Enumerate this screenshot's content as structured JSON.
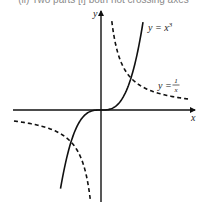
{
  "caption": "(ii) Two parts [i] both not crossing axes",
  "chart_data": {
    "type": "line",
    "title": "",
    "xlabel": "x",
    "ylabel": "y",
    "grid": false,
    "legend": "inline labels",
    "axis_origin_px": [
      101,
      110
    ],
    "scale_px_per_unit": {
      "x": 30,
      "y": 32
    },
    "series": [
      {
        "name": "y = x^3",
        "label": "y = x³",
        "style": "solid",
        "function": "x^3",
        "x_range": [
          -1.35,
          1.4
        ],
        "points": [
          [
            -1.35,
            -2.46
          ],
          [
            -1,
            -1
          ],
          [
            -0.5,
            -0.125
          ],
          [
            0,
            0
          ],
          [
            0.5,
            0.125
          ],
          [
            1,
            1
          ],
          [
            1.4,
            2.74
          ]
        ]
      },
      {
        "name": "y = 1/x",
        "label": "y = 1/x",
        "style": "dashed",
        "function": "1/x",
        "branches": [
          {
            "x_range": [
              0.36,
              2.9
            ],
            "points": [
              [
                0.36,
                2.78
              ],
              [
                0.5,
                2
              ],
              [
                1,
                1
              ],
              [
                2,
                0.5
              ],
              [
                2.9,
                0.345
              ]
            ]
          },
          {
            "x_range": [
              -2.9,
              -0.36
            ],
            "points": [
              [
                -2.9,
                -0.345
              ],
              [
                -2,
                -0.5
              ],
              [
                -1,
                -1
              ],
              [
                -0.5,
                -2
              ],
              [
                -0.36,
                -2.78
              ]
            ]
          }
        ]
      },
      {
        "name": "intersections",
        "points": [
          [
            1,
            1
          ],
          [
            -1,
            -1
          ]
        ]
      }
    ],
    "labels": {
      "cubic_eq": "y = x",
      "cubic_exp": "3",
      "recip_y": "y =",
      "recip_num": "1",
      "recip_den": "x",
      "x_axis": "x",
      "y_axis": "y"
    }
  }
}
